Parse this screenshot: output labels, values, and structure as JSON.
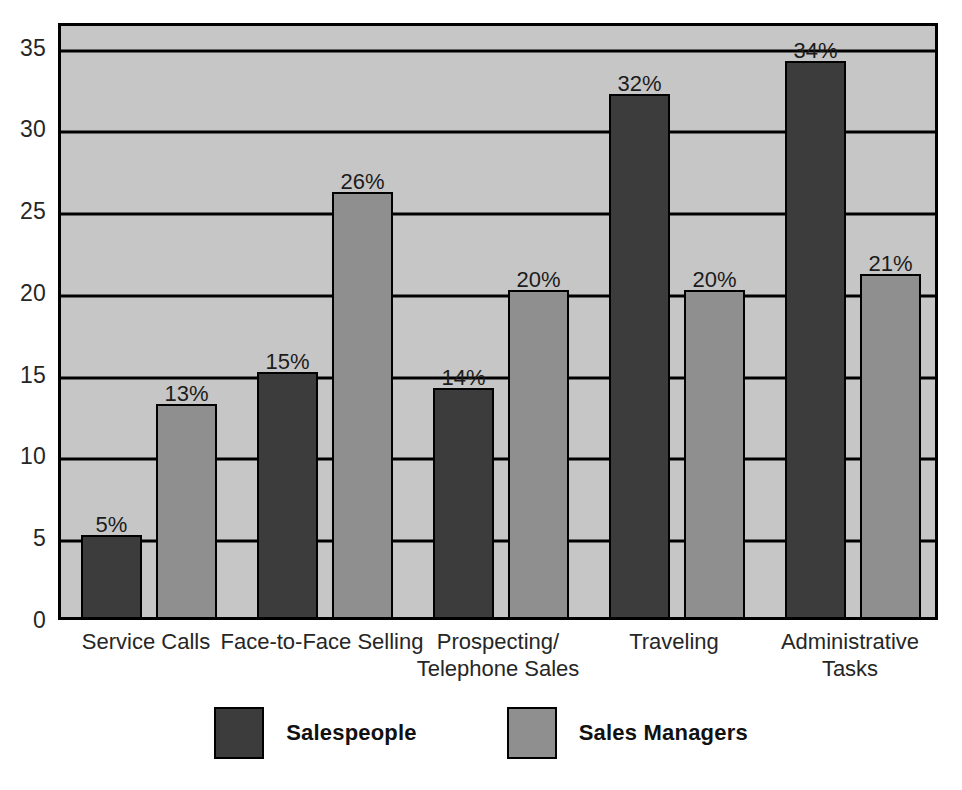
{
  "chart_data": {
    "type": "bar",
    "title": "",
    "subtitle": "",
    "xlabel": "",
    "ylabel": "",
    "ylim": [
      0,
      36.5
    ],
    "yticks": [
      0,
      5,
      10,
      15,
      20,
      25,
      30,
      35
    ],
    "ytick_labels": [
      "0",
      "5",
      "10",
      "15",
      "20",
      "25",
      "30",
      "35"
    ],
    "grid": true,
    "grid_axis": "y",
    "legend_position": "bottom-center",
    "value_label_suffix": "%",
    "categories": [
      "Service Calls",
      "Face-to-Face Selling",
      "Prospecting/\nTelephone Sales",
      "Traveling",
      "Administrative Tasks"
    ],
    "series": [
      {
        "name": "Salespeople",
        "color": "#3c3c3c",
        "values": [
          5,
          15,
          14,
          32,
          34
        ],
        "labels": [
          "5%",
          "15%",
          "14%",
          "32%",
          "34%"
        ]
      },
      {
        "name": "Sales Managers",
        "color": "#8f8f8f",
        "values": [
          13,
          26,
          20,
          20,
          21
        ],
        "labels": [
          "13%",
          "26%",
          "20%",
          "20%",
          "21%"
        ]
      }
    ]
  },
  "colors": {
    "plot_background": "#c6c6c6",
    "page_background": "#ffffff",
    "axis_line": "#000000",
    "gridline": "#000000",
    "series_salespeople": "#3c3c3c",
    "series_sales_managers": "#8f8f8f",
    "text": "#262626"
  },
  "legend": {
    "items": [
      {
        "label": "Salespeople",
        "color": "#3c3c3c"
      },
      {
        "label": "Sales Managers",
        "color": "#8f8f8f"
      }
    ]
  }
}
